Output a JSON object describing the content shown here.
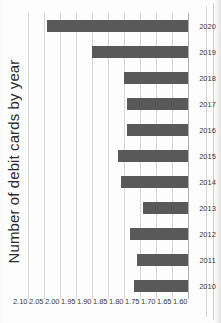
{
  "page": {
    "kind": "scanned-document-chart",
    "background_color": "#fdfdfd",
    "bar_color": "#595959",
    "gridline_color": "#d5d5d5",
    "text_color": "#2b2b2b"
  },
  "chart_data": {
    "type": "bar",
    "orientation": "horizontal",
    "title": "Number of debit cards by year",
    "xlabel": "",
    "ylabel": "",
    "categories": [
      "2010",
      "2011",
      "2012",
      "2013",
      "2014",
      "2015",
      "2016",
      "2017",
      "2018",
      "2019",
      "2020"
    ],
    "values": [
      1.77,
      1.76,
      1.78,
      1.74,
      1.81,
      1.82,
      1.79,
      1.79,
      1.8,
      1.9,
      2.04
    ],
    "value_axis_ticks": [
      "2.10",
      "2.05",
      "2.00",
      "1.95",
      "1.90",
      "1.85",
      "1.80",
      "1.75",
      "1.70",
      "1.65",
      "1.60"
    ],
    "value_axis_tick_values": [
      2.1,
      2.05,
      2.0,
      1.95,
      1.9,
      1.85,
      1.8,
      1.75,
      1.7,
      1.65,
      1.6
    ],
    "value_axis_min": 1.6,
    "value_axis_max": 2.1,
    "value_axis_reversed": true,
    "grid": true,
    "legend": false,
    "legend_position": "none",
    "series": [
      {
        "name": "Number of debit cards",
        "values": [
          1.77,
          1.76,
          1.78,
          1.74,
          1.81,
          1.82,
          1.79,
          1.79,
          1.8,
          1.9,
          2.04
        ]
      }
    ]
  }
}
